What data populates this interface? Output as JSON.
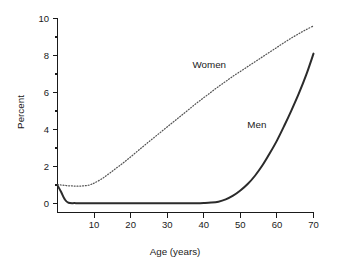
{
  "chart_data": {
    "type": "line",
    "title": "",
    "xlabel": "Age (years)",
    "ylabel": "Percent",
    "xlim": [
      0,
      70
    ],
    "ylim": [
      -0.35,
      10
    ],
    "grid": false,
    "legend_position": "inline-annotations",
    "x_ticks": [
      10,
      20,
      30,
      40,
      50,
      60,
      70
    ],
    "x_tick_labels": [
      "10",
      "20",
      "30",
      "40",
      "50",
      "60",
      "70"
    ],
    "y_ticks": [
      0,
      2,
      4,
      6,
      8,
      10
    ],
    "y_tick_labels": [
      "0",
      "2",
      "4",
      "6",
      "8",
      "10"
    ],
    "y_minor_ticks": [
      1,
      3,
      5,
      7,
      9
    ],
    "annotations": [
      {
        "text": "Women",
        "x": 41.5,
        "y": 7.35
      },
      {
        "text": "Men",
        "x": 54.5,
        "y": 4.1
      }
    ],
    "series": [
      {
        "name": "Women",
        "style": "dotted",
        "color": "#555555",
        "x": [
          0,
          1,
          2,
          3,
          4,
          5,
          6,
          7,
          8,
          9,
          10,
          12,
          14,
          16,
          18,
          20,
          22,
          24,
          26,
          28,
          30,
          32,
          34,
          36,
          38,
          40,
          42,
          44,
          46,
          48,
          50,
          52,
          54,
          56,
          58,
          60,
          62,
          64,
          66,
          68,
          70
        ],
        "values": [
          1.02,
          1.0,
          0.98,
          0.96,
          0.95,
          0.94,
          0.94,
          0.95,
          0.97,
          1.02,
          1.1,
          1.32,
          1.6,
          1.9,
          2.2,
          2.52,
          2.85,
          3.18,
          3.5,
          3.82,
          4.14,
          4.46,
          4.78,
          5.1,
          5.42,
          5.72,
          6.02,
          6.32,
          6.6,
          6.88,
          7.14,
          7.4,
          7.66,
          7.92,
          8.18,
          8.44,
          8.7,
          8.95,
          9.18,
          9.4,
          9.6
        ]
      },
      {
        "name": "Men",
        "style": "solid",
        "color": "#2b2b2b",
        "x": [
          0,
          1,
          2,
          3,
          5,
          10,
          15,
          20,
          25,
          30,
          35,
          38,
          40,
          42,
          44,
          46,
          48,
          50,
          52,
          54,
          56,
          58,
          60,
          62,
          64,
          66,
          68,
          70
        ],
        "values": [
          0.98,
          0.62,
          0.22,
          0.04,
          0.02,
          0.02,
          0.02,
          0.02,
          0.02,
          0.02,
          0.02,
          0.02,
          0.03,
          0.05,
          0.1,
          0.22,
          0.42,
          0.7,
          1.05,
          1.5,
          2.05,
          2.7,
          3.4,
          4.2,
          5.05,
          5.95,
          6.95,
          8.1
        ]
      }
    ]
  },
  "axes": {
    "y_title": "Percent",
    "x_title": "Age (years)"
  }
}
